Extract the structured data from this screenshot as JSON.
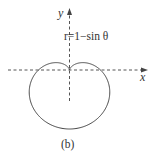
{
  "figure": {
    "caption": "(b)",
    "equation_label": "r=1−sin θ",
    "x_axis_label": "x",
    "y_axis_label": "y",
    "curve": {
      "type": "cardioid",
      "equation": "r = 1 - sin(theta)",
      "color": "#444444"
    },
    "axes_color": "#555555"
  }
}
